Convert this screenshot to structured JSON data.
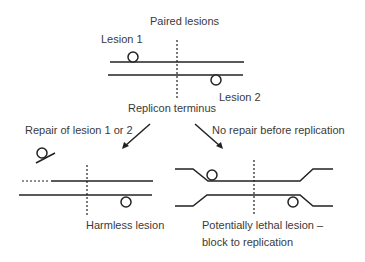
{
  "diagram": {
    "title": "Paired lesions",
    "labels": {
      "lesion1": "Lesion 1",
      "lesion2": "Lesion 2",
      "replicon_terminus": "Replicon terminus",
      "repair_branch": "Repair of lesion 1 or 2",
      "no_repair_branch": "No repair before replication",
      "harmless": "Harmless lesion",
      "lethal_line1": "Potentially lethal lesion –",
      "lethal_line2": "block to replication"
    },
    "colors": {
      "stroke": "#222222",
      "text": "#3a3a3a",
      "background": "#ffffff"
    }
  }
}
